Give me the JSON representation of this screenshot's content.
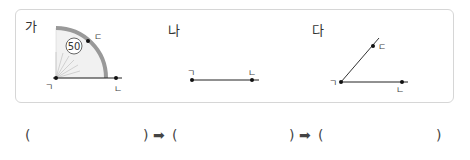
{
  "figures": [
    {
      "label": "가",
      "vertices": [
        "ㄱ",
        "ㄴ",
        "ㄷ"
      ],
      "protractor_reading": "50"
    },
    {
      "label": "나",
      "vertices": [
        "ㄱ",
        "ㄴ"
      ]
    },
    {
      "label": "다",
      "vertices": [
        "ㄱ",
        "ㄴ",
        "ㄷ"
      ]
    }
  ],
  "answer_row": {
    "open": "(",
    "close": ")",
    "arrow": "➡"
  }
}
